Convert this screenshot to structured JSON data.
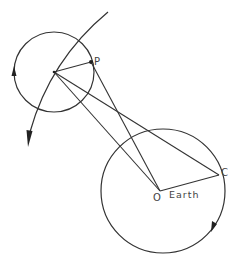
{
  "diagram": {
    "labels": {
      "p": "P",
      "c": "C",
      "o": "O",
      "earth": "Earth"
    },
    "colors": {
      "stroke": "#333333",
      "text": "#444444",
      "background": "#ffffff"
    }
  }
}
